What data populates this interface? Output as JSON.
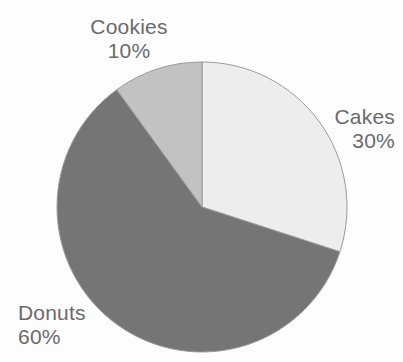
{
  "chart_data": {
    "type": "pie",
    "title": "",
    "subtitle": "",
    "xlabel": "",
    "ylabel": "",
    "grid": false,
    "legend_position": "none",
    "label_format": "name + percent, outside slices",
    "start_angle_deg": 0,
    "direction": "clockwise",
    "categories": [
      "Cakes",
      "Donuts",
      "Cookies"
    ],
    "values": [
      30,
      60,
      10
    ],
    "units": "percent",
    "slices": [
      {
        "name": "Cakes",
        "value": 30,
        "percent_label": "30%",
        "color": "#ededed",
        "start_angle_deg": 0,
        "end_angle_deg": 108,
        "label_position": "right"
      },
      {
        "name": "Donuts",
        "value": 60,
        "percent_label": "60%",
        "color": "#757575",
        "start_angle_deg": 108,
        "end_angle_deg": 324,
        "label_position": "bottom-left"
      },
      {
        "name": "Cookies",
        "value": 10,
        "percent_label": "10%",
        "color": "#c2c2c2",
        "start_angle_deg": 324,
        "end_angle_deg": 360,
        "label_position": "top"
      }
    ],
    "geometry": {
      "center_x": 202,
      "center_y": 207,
      "radius": 145
    },
    "style": {
      "background": "#fdfdfd",
      "text_color": "#6a6a6a",
      "outline_color": "#9a9a9a",
      "outline_width": 1
    }
  }
}
